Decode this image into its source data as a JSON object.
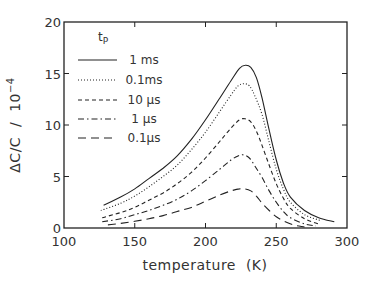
{
  "chart_data": {
    "type": "line",
    "title": "",
    "xlabel": "temperature  (K)",
    "ylabel": "ΔC/C  /  10",
    "ylabel_exponent": "−4",
    "xlim": [
      100,
      300
    ],
    "ylim": [
      0,
      20
    ],
    "xticks": [
      100,
      150,
      200,
      250,
      300
    ],
    "yticks": [
      0,
      5,
      10,
      15,
      20
    ],
    "grid": false,
    "legend_position": "upper-left",
    "legend_title": "t",
    "legend_title_sub": "P",
    "series": [
      {
        "name": "1 ms",
        "style": "solid",
        "x": [
          128,
          140,
          150,
          160,
          170,
          180,
          190,
          200,
          210,
          218,
          224,
          228,
          232,
          236,
          240,
          245,
          250,
          255,
          260,
          270,
          280,
          291
        ],
        "y": [
          2.2,
          3.0,
          3.8,
          4.8,
          5.8,
          7.0,
          8.6,
          10.5,
          12.6,
          14.3,
          15.5,
          15.8,
          15.6,
          14.6,
          12.6,
          9.5,
          6.6,
          4.4,
          3.0,
          1.7,
          1.0,
          0.6
        ]
      },
      {
        "name": "0.1ms",
        "style": "dotted",
        "x": [
          126,
          140,
          150,
          160,
          170,
          180,
          190,
          200,
          210,
          218,
          223,
          227,
          231,
          235,
          240,
          245,
          250,
          255,
          260,
          270,
          282
        ],
        "y": [
          1.7,
          2.4,
          3.1,
          4.0,
          5.0,
          6.1,
          7.6,
          9.3,
          11.3,
          12.9,
          13.8,
          14.0,
          13.8,
          12.8,
          11.0,
          8.3,
          5.7,
          3.8,
          2.5,
          1.3,
          0.7
        ]
      },
      {
        "name": "10 μs",
        "style": "dashed",
        "x": [
          127,
          140,
          150,
          160,
          170,
          180,
          190,
          200,
          210,
          218,
          224,
          228,
          232,
          236,
          240,
          245,
          250,
          255,
          260,
          270,
          280
        ],
        "y": [
          1.0,
          1.5,
          2.0,
          2.7,
          3.4,
          4.3,
          5.4,
          6.8,
          8.4,
          9.7,
          10.5,
          10.6,
          10.3,
          9.4,
          8.0,
          6.1,
          4.3,
          2.9,
          1.9,
          0.9,
          0.4
        ]
      },
      {
        "name": "1 μs",
        "style": "dashdot",
        "x": [
          127,
          140,
          150,
          160,
          170,
          180,
          190,
          200,
          210,
          218,
          223,
          227,
          231,
          235,
          240,
          245,
          250,
          255,
          260,
          270,
          278
        ],
        "y": [
          0.6,
          0.9,
          1.3,
          1.7,
          2.2,
          2.8,
          3.6,
          4.6,
          5.7,
          6.6,
          7.0,
          7.1,
          6.8,
          6.0,
          4.9,
          3.6,
          2.5,
          1.6,
          1.0,
          0.4,
          0.2
        ]
      },
      {
        "name": "0.1μs",
        "style": "longdash",
        "x": [
          131,
          140,
          150,
          160,
          170,
          180,
          190,
          200,
          210,
          218,
          224,
          228,
          232,
          236,
          240,
          245,
          250,
          255,
          262,
          270
        ],
        "y": [
          0.3,
          0.45,
          0.65,
          0.9,
          1.2,
          1.6,
          2.0,
          2.6,
          3.2,
          3.6,
          3.8,
          3.8,
          3.6,
          3.1,
          2.4,
          1.7,
          1.1,
          0.7,
          0.3,
          0.1
        ]
      }
    ]
  }
}
